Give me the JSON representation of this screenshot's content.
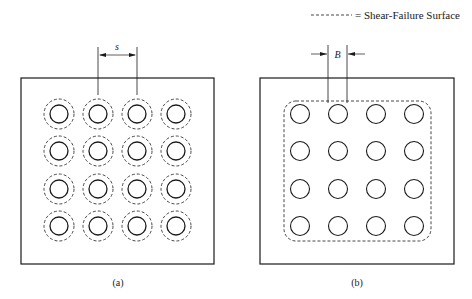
{
  "legend": {
    "line_style": "dashed",
    "label": "= Shear-Failure Surface"
  },
  "panels": [
    {
      "id": "a",
      "caption": "(a)",
      "dimension_label": "s",
      "dimension_meaning": "pile spacing",
      "grid": {
        "rows": 4,
        "cols": 4
      },
      "failure_surface": "individual dashed circle around each pile"
    },
    {
      "id": "b",
      "caption": "(b)",
      "dimension_label": "B",
      "dimension_meaning": "pile diameter",
      "grid": {
        "rows": 4,
        "cols": 4
      },
      "failure_surface": "single dashed rounded rectangle around pile group (block failure)"
    }
  ],
  "colors": {
    "stroke": "#1a1a1a",
    "background": "#ffffff"
  }
}
